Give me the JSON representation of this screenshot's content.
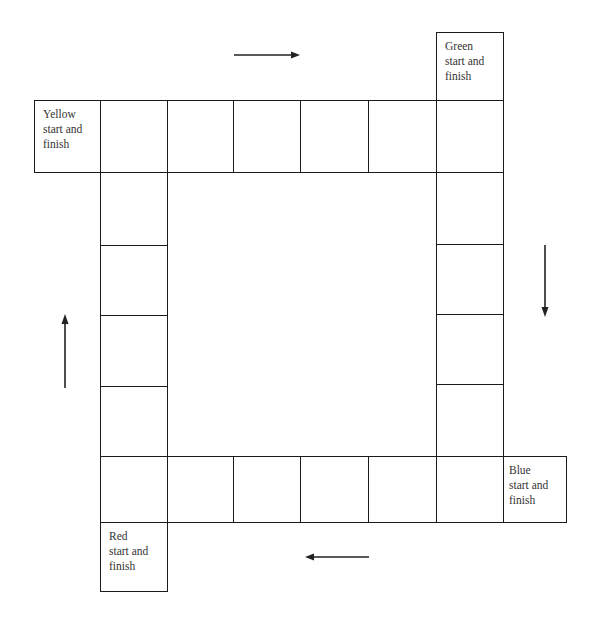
{
  "board": {
    "title": "",
    "start_squares": [
      {
        "color": "Yellow",
        "line1": "Yellow",
        "line2": "start and",
        "line3": "finish"
      },
      {
        "color": "Green",
        "line1": "Green",
        "line2": "start and",
        "line3": "finish"
      },
      {
        "color": "Blue",
        "line1": "Blue",
        "line2": "start and",
        "line3": "finish"
      },
      {
        "color": "Red",
        "line1": "Red",
        "line2": "start and",
        "line3": "finish"
      }
    ],
    "track": {
      "top_row_cells": 6,
      "right_column_cells": 6,
      "bottom_row_cells": 6,
      "left_column_cells": 6,
      "total_cells": 20
    },
    "arrows": [
      {
        "position": "top",
        "direction": "right"
      },
      {
        "position": "right",
        "direction": "down"
      },
      {
        "position": "bottom",
        "direction": "left"
      },
      {
        "position": "left",
        "direction": "up"
      }
    ],
    "line_color": "#1a1a1a",
    "background": "#ffffff"
  }
}
